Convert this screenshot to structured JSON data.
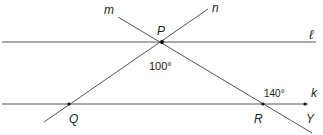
{
  "diagram": {
    "colors": {
      "line": "#555555",
      "point": "#111111",
      "text": "#222222",
      "background": "#ffffff"
    },
    "lines": {
      "l": {
        "label": "ℓ",
        "x1": 2,
        "y1": 42,
        "x2": 316,
        "y2": 42
      },
      "k": {
        "label": "k",
        "x1": 2,
        "y1": 104,
        "x2": 308,
        "y2": 104
      },
      "m": {
        "label": "m",
        "x1": 118,
        "y1": 17,
        "x2": 312,
        "y2": 133
      },
      "n": {
        "label": "n",
        "x1": 208,
        "y1": 9,
        "x2": 44,
        "y2": 122
      }
    },
    "points": {
      "P": {
        "label": "P",
        "x": 162,
        "y": 42
      },
      "Q": {
        "label": "Q",
        "x": 69,
        "y": 104
      },
      "R": {
        "label": "R",
        "x": 263,
        "y": 104
      },
      "Y": {
        "label": "Y",
        "x": 305,
        "y": 104
      }
    },
    "angles": {
      "at_P": {
        "label": "100°",
        "value": 100
      },
      "at_R": {
        "label": "140°",
        "value": 140
      }
    }
  }
}
